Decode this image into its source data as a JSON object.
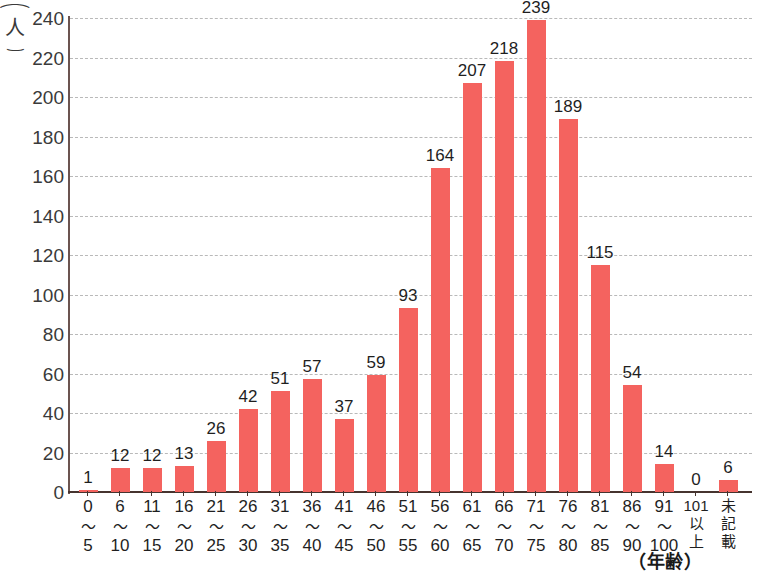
{
  "chart_data": {
    "type": "bar",
    "title": "",
    "xlabel": "（年齢）",
    "ylabel": "（人）",
    "ylim": [
      0,
      240
    ],
    "ytick_step": 20,
    "yticks": [
      0,
      20,
      40,
      60,
      80,
      100,
      120,
      140,
      160,
      180,
      200,
      220,
      240
    ],
    "grid": true,
    "legend": "none",
    "bar_color": "#f4635f",
    "axis_color": "#46342f",
    "grid_color": "#b9b9b9",
    "categories": [
      "0〜5",
      "6〜10",
      "11〜15",
      "16〜20",
      "21〜25",
      "26〜30",
      "31〜35",
      "36〜40",
      "41〜45",
      "46〜50",
      "51〜55",
      "56〜60",
      "61〜65",
      "66〜70",
      "71〜75",
      "76〜80",
      "81〜85",
      "86〜90",
      "91〜100",
      "101以上",
      "未記載"
    ],
    "category_parts": [
      {
        "lo": "0",
        "hi": "5",
        "vertical": false
      },
      {
        "lo": "6",
        "hi": "10",
        "vertical": false
      },
      {
        "lo": "11",
        "hi": "15",
        "vertical": false
      },
      {
        "lo": "16",
        "hi": "20",
        "vertical": false
      },
      {
        "lo": "21",
        "hi": "25",
        "vertical": false
      },
      {
        "lo": "26",
        "hi": "30",
        "vertical": false
      },
      {
        "lo": "31",
        "hi": "35",
        "vertical": false
      },
      {
        "lo": "36",
        "hi": "40",
        "vertical": false
      },
      {
        "lo": "41",
        "hi": "45",
        "vertical": false
      },
      {
        "lo": "46",
        "hi": "50",
        "vertical": false
      },
      {
        "lo": "51",
        "hi": "55",
        "vertical": false
      },
      {
        "lo": "56",
        "hi": "60",
        "vertical": false
      },
      {
        "lo": "61",
        "hi": "65",
        "vertical": false
      },
      {
        "lo": "66",
        "hi": "70",
        "vertical": false
      },
      {
        "lo": "71",
        "hi": "75",
        "vertical": false
      },
      {
        "lo": "76",
        "hi": "80",
        "vertical": false
      },
      {
        "lo": "81",
        "hi": "85",
        "vertical": false
      },
      {
        "lo": "86",
        "hi": "90",
        "vertical": false
      },
      {
        "lo": "91",
        "hi": "100",
        "vertical": false
      },
      {
        "chars": [
          "101",
          "以",
          "上"
        ],
        "vertical": true
      },
      {
        "chars": [
          "未",
          "記",
          "載"
        ],
        "vertical": true
      }
    ],
    "values": [
      1,
      12,
      12,
      13,
      26,
      42,
      51,
      57,
      37,
      59,
      93,
      164,
      207,
      218,
      239,
      189,
      115,
      54,
      14,
      0,
      6
    ],
    "tilde": "〜"
  },
  "caption": {
    "bottom_cut_text": ""
  }
}
